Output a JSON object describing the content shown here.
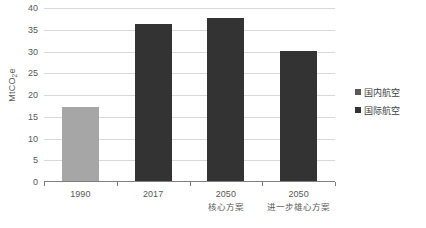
{
  "chart_data": {
    "type": "bar",
    "title": "",
    "xlabel": "",
    "ylabel": "MtCO2e",
    "ylabel_main": "MtCO",
    "ylabel_sub": "2",
    "ylabel_tail": "e",
    "categories": [
      "1990",
      "2017",
      "2050",
      "2050"
    ],
    "category_sublabels": [
      "",
      "",
      "核心方案",
      "进一步雄心方案"
    ],
    "values": [
      17.2,
      36.4,
      37.8,
      30.2
    ],
    "series": [
      {
        "name": "国内航空",
        "values": [
          17.2,
          36.4,
          37.8,
          30.2
        ],
        "color": "#333333"
      }
    ],
    "bar_colors": [
      "#a6a6a6",
      "#333333",
      "#333333",
      "#333333"
    ],
    "ylim": [
      0,
      40
    ],
    "ytick_values": [
      0,
      5,
      10,
      15,
      20,
      25,
      30,
      35,
      40
    ],
    "ytick_labels": [
      "0",
      "5",
      "10",
      "15",
      "20",
      "25",
      "30",
      "35",
      "40"
    ],
    "grid": true,
    "legend_position": "right"
  },
  "legend": {
    "items": [
      {
        "label": "国内航空",
        "color": "#595959"
      },
      {
        "label": "国际航空",
        "color": "#333333"
      }
    ]
  },
  "colors": {
    "bar_light": "#a6a6a6",
    "bar_dark": "#333333",
    "gridline": "#d9d9d9",
    "axis": "#7f7f7f",
    "text": "#595959",
    "background": "#ffffff"
  }
}
